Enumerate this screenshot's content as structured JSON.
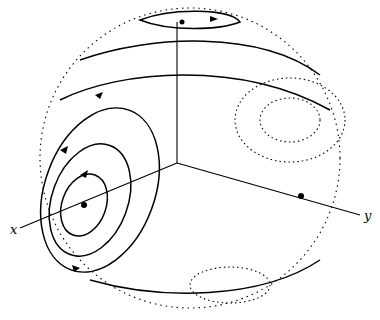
{
  "figure": {
    "type": "sphere-flow-diagram",
    "axes": {
      "x_label": "x",
      "y_label": "y",
      "z_label": ""
    },
    "fixed_points": [
      {
        "name": "x-axis-point",
        "x": 84,
        "y": 205
      },
      {
        "name": "y-axis-point",
        "x": 301,
        "y": 196
      },
      {
        "name": "top-point",
        "x": 182,
        "y": 22
      }
    ],
    "colors": {
      "stroke": "#000000",
      "background": "#ffffff"
    }
  }
}
